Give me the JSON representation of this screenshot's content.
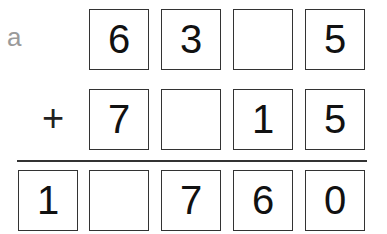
{
  "problem_label": "a",
  "operator": "+",
  "rows": {
    "addend1": [
      "",
      "6",
      "3",
      "",
      "5"
    ],
    "addend2": [
      "",
      "7",
      "",
      "1",
      "5"
    ],
    "sum": [
      "1",
      "",
      "7",
      "6",
      "0"
    ]
  }
}
